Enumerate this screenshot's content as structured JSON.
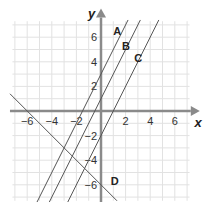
{
  "chart_data": {
    "type": "line",
    "title": "",
    "xlabel": "x",
    "ylabel": "y",
    "xlim": [
      -7.5,
      7.5
    ],
    "ylim": [
      -7.5,
      7.5
    ],
    "grid": true,
    "grid_step": 1,
    "x_ticks": [
      -6,
      -4,
      -2,
      2,
      4,
      6
    ],
    "y_ticks": [
      6,
      4,
      2,
      -2,
      -4,
      -6
    ],
    "x_tick_labels": [
      "−6",
      "−4",
      "−2",
      "2",
      "4",
      "6"
    ],
    "y_tick_labels": [
      "6",
      "4",
      "2",
      "−2",
      "−4",
      "−6"
    ],
    "series": [
      {
        "name": "A",
        "equation": "y = 2x + 3",
        "slope": 2,
        "intercept": 3,
        "x_range": [
          -5.2,
          2.2
        ],
        "label_pos": [
          1.0,
          6.2
        ]
      },
      {
        "name": "B",
        "equation": "y = 2x + 1",
        "slope": 2,
        "intercept": 1,
        "x_range": [
          -4.2,
          3.2
        ],
        "label_pos": [
          1.7,
          5.0
        ]
      },
      {
        "name": "C",
        "equation": "y = 2x - 2",
        "slope": 2,
        "intercept": -2,
        "x_range": [
          -2.7,
          4.7
        ],
        "label_pos": [
          2.7,
          4.0
        ]
      },
      {
        "name": "D",
        "equation": "y = -x - 6",
        "slope": -1,
        "intercept": -6,
        "x_range": [
          -7.4,
          1.3
        ],
        "label_pos": [
          0.8,
          -6.0
        ]
      }
    ],
    "legend": "inline labels near each line"
  },
  "layout": {
    "origin_px": [
      101,
      111
    ],
    "unit_px": 12.3,
    "colors": {
      "grid": "#e2e2e2",
      "axis": "#8a8a8a",
      "line": "#555555",
      "text": "#222222"
    }
  }
}
